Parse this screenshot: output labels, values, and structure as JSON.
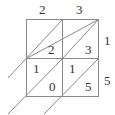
{
  "diagram": {
    "type": "lattice-multiplication",
    "top_digits": [
      "2",
      "3"
    ],
    "right_digits": [
      "1",
      "5"
    ],
    "cells": [
      [
        {
          "tens": "",
          "ones": "2"
        },
        {
          "tens": "",
          "ones": "3"
        }
      ],
      [
        {
          "tens": "1",
          "ones": "0"
        },
        {
          "tens": "1",
          "ones": "5"
        }
      ]
    ],
    "colors": {
      "line": "#8a8a8a",
      "text": "#333333"
    }
  }
}
